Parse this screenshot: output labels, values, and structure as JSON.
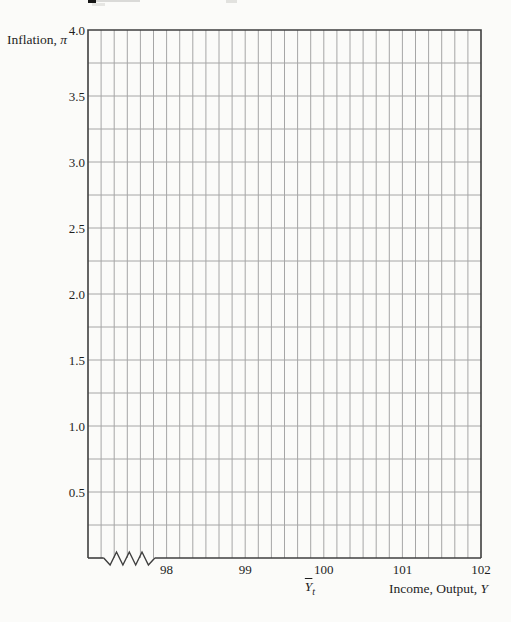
{
  "chart_data": {
    "type": "line",
    "title": "",
    "xlabel": "Income, Output, Y",
    "ylabel": "Inflation, π",
    "xlim": [
      97,
      102
    ],
    "ylim": [
      0,
      4
    ],
    "x_tick_values": [
      98,
      99,
      100,
      101,
      102
    ],
    "x_tick_labels": [
      "98",
      "99",
      "100",
      "101",
      "102"
    ],
    "y_tick_values": [
      4.0,
      3.5,
      3.0,
      2.5,
      2.0,
      1.5,
      1.0,
      0.5
    ],
    "y_tick_labels": [
      "4.0",
      "3.5",
      "3.0",
      "2.5",
      "2.0",
      "1.5",
      "1.0",
      "0.5"
    ],
    "x_minor_divisions_per_unit": 6,
    "y_minor_step": 0.25,
    "grid": true,
    "legend": "none",
    "series": [],
    "axis_break": {
      "axis": "x",
      "location_units": [
        97.2,
        97.85
      ]
    },
    "annotations": [
      {
        "text": "Ȳt",
        "base": "Y",
        "sub": "t",
        "x": 100,
        "placement": "below x-axis, marks potential output"
      }
    ]
  },
  "labels": {
    "y_axis_title_prefix": "Inflation, ",
    "y_axis_title_var": "π",
    "x_axis_title_prefix": "Income, Output, ",
    "x_axis_title_var": "Y",
    "potential_output_base": "Y",
    "potential_output_sub": "t"
  },
  "colors": {
    "background": "#fbfbf9",
    "grid_line": "#a6a6a6",
    "axis_border": "#3f3f3f",
    "text": "#1e1e1e",
    "artifact_black_fragment": "#161616",
    "artifact_gray_smudge": "#dadad8"
  }
}
